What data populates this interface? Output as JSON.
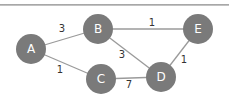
{
  "diagram": {
    "type": "weighted-undirected-graph",
    "colors": {
      "node_fill": "#7a7a7a",
      "edge": "#9a9a9a",
      "node_text": "#ffffff",
      "weight_text": "#333333"
    },
    "nodes": [
      {
        "id": "A",
        "label": "A",
        "x": 31,
        "y": 49
      },
      {
        "id": "B",
        "label": "B",
        "x": 98,
        "y": 29
      },
      {
        "id": "C",
        "label": "C",
        "x": 101,
        "y": 79
      },
      {
        "id": "D",
        "label": "D",
        "x": 161,
        "y": 77
      },
      {
        "id": "E",
        "label": "E",
        "x": 198,
        "y": 29
      }
    ],
    "edges": [
      {
        "from": "A",
        "to": "B",
        "weight": "3",
        "lx": 62,
        "ly": 28
      },
      {
        "from": "A",
        "to": "C",
        "weight": "1",
        "lx": 60,
        "ly": 69
      },
      {
        "from": "B",
        "to": "E",
        "weight": "1",
        "lx": 152,
        "ly": 22
      },
      {
        "from": "B",
        "to": "D",
        "weight": "3",
        "lx": 122,
        "ly": 54
      },
      {
        "from": "C",
        "to": "D",
        "weight": "7",
        "lx": 129,
        "ly": 84
      },
      {
        "from": "E",
        "to": "D",
        "weight": "1",
        "lx": 184,
        "ly": 59
      }
    ]
  }
}
